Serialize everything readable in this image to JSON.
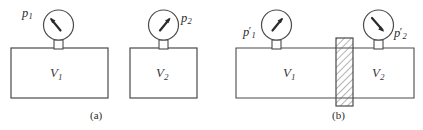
{
  "figure": {
    "width": 423,
    "height": 130,
    "background": "#ffffff",
    "line_color": "#4a4a4a",
    "text_color": "#2b2b2b",
    "hatch_color": "#6a6a6a"
  },
  "panel_a": {
    "caption": "(a)",
    "vessel_1": {
      "volume_label": "V",
      "volume_subscript": "1",
      "gauge_label": "p",
      "gauge_subscript": "1",
      "gauge_prime": "",
      "needle_direction": "up-left"
    },
    "vessel_2": {
      "volume_label": "V",
      "volume_subscript": "2",
      "gauge_label": "p",
      "gauge_subscript": "2",
      "gauge_prime": "",
      "needle_direction": "up-right"
    }
  },
  "panel_b": {
    "caption": "(b)",
    "vessel_1": {
      "volume_label": "V",
      "volume_subscript": "1",
      "gauge_label": "p",
      "gauge_subscript": "1",
      "gauge_prime": "′",
      "needle_direction": "up-right"
    },
    "vessel_2": {
      "volume_label": "V",
      "volume_subscript": "2",
      "gauge_label": "p",
      "gauge_subscript": "2",
      "gauge_prime": "′",
      "needle_direction": "down-right"
    },
    "partition": {
      "name": "hatched-partition",
      "fill_pattern": "diagonal-hatch"
    }
  }
}
